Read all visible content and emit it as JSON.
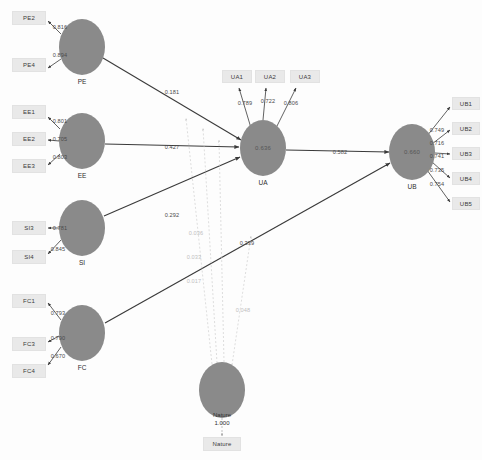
{
  "diagram": {
    "type": "sem-path-diagram",
    "colors": {
      "construct_fill": "#8a8a8a",
      "indicator_fill": "#e9e9e9",
      "edge": "#3a3a3a",
      "moderation_edge": "#c8c8c8",
      "background": "#fdfdfd"
    }
  },
  "constructs": [
    {
      "id": "PE",
      "label": "PE",
      "r2": "",
      "cx": 82,
      "cy": 47,
      "rx": 23,
      "ry": 28
    },
    {
      "id": "EE",
      "label": "EE",
      "r2": "",
      "cx": 82,
      "cy": 141,
      "rx": 23,
      "ry": 28
    },
    {
      "id": "SI",
      "label": "SI",
      "r2": "",
      "cx": 82,
      "cy": 228,
      "rx": 23,
      "ry": 28
    },
    {
      "id": "FC",
      "label": "FC",
      "r2": "",
      "cx": 82,
      "cy": 333,
      "rx": 23,
      "ry": 28
    },
    {
      "id": "UA",
      "label": "UA",
      "r2": "0.636",
      "cx": 263,
      "cy": 148,
      "rx": 23,
      "ry": 28
    },
    {
      "id": "UB",
      "label": "UB",
      "r2": "0.660",
      "cx": 412,
      "cy": 152,
      "rx": 23,
      "ry": 28
    },
    {
      "id": "NATURE",
      "label": "",
      "r2": "",
      "cx": 222,
      "cy": 390,
      "rx": 23,
      "ry": 28
    }
  ],
  "indicators": [
    {
      "id": "PE2",
      "label": "PE2",
      "x": 12,
      "y": 11,
      "w": 34,
      "h": 14
    },
    {
      "id": "PE4",
      "label": "PE4",
      "x": 12,
      "y": 58,
      "w": 34,
      "h": 14
    },
    {
      "id": "EE1",
      "label": "EE1",
      "x": 12,
      "y": 105,
      "w": 34,
      "h": 14
    },
    {
      "id": "EE2",
      "label": "EE2",
      "x": 12,
      "y": 132,
      "w": 34,
      "h": 14
    },
    {
      "id": "EE3",
      "label": "EE3",
      "x": 12,
      "y": 159,
      "w": 34,
      "h": 14
    },
    {
      "id": "SI3",
      "label": "SI3",
      "x": 12,
      "y": 221,
      "w": 34,
      "h": 14
    },
    {
      "id": "SI4",
      "label": "SI4",
      "x": 12,
      "y": 250,
      "w": 34,
      "h": 14
    },
    {
      "id": "FC1",
      "label": "FC1",
      "x": 12,
      "y": 294,
      "w": 34,
      "h": 14
    },
    {
      "id": "FC3",
      "label": "FC3",
      "x": 12,
      "y": 337,
      "w": 34,
      "h": 14
    },
    {
      "id": "FC4",
      "label": "FC4",
      "x": 12,
      "y": 364,
      "w": 34,
      "h": 14
    },
    {
      "id": "UA1",
      "label": "UA1",
      "x": 222,
      "y": 70,
      "w": 30,
      "h": 13
    },
    {
      "id": "UA2",
      "label": "UA2",
      "x": 255,
      "y": 70,
      "w": 30,
      "h": 13
    },
    {
      "id": "UA3",
      "label": "UA3",
      "x": 290,
      "y": 70,
      "w": 30,
      "h": 13
    },
    {
      "id": "UB1",
      "label": "UB1",
      "x": 452,
      "y": 97,
      "w": 28,
      "h": 13
    },
    {
      "id": "UB2",
      "label": "UB2",
      "x": 452,
      "y": 122,
      "w": 28,
      "h": 13
    },
    {
      "id": "UB3",
      "label": "UB3",
      "x": 452,
      "y": 147,
      "w": 28,
      "h": 13
    },
    {
      "id": "UB4",
      "label": "UB4",
      "x": 452,
      "y": 172,
      "w": 28,
      "h": 13
    },
    {
      "id": "UB5",
      "label": "UB5",
      "x": 452,
      "y": 197,
      "w": 28,
      "h": 13
    },
    {
      "id": "NatureInd",
      "label": "Nature",
      "x": 203,
      "y": 437,
      "w": 38,
      "h": 14
    }
  ],
  "measurement_loadings": [
    {
      "from": "PE",
      "to": "PE2",
      "value": "0.816",
      "lx": 60,
      "ly": 27
    },
    {
      "from": "PE",
      "to": "PE4",
      "value": "0.894",
      "lx": 60,
      "ly": 55
    },
    {
      "from": "EE",
      "to": "EE1",
      "value": "0.801",
      "lx": 60,
      "ly": 121
    },
    {
      "from": "EE",
      "to": "EE2",
      "value": "0.705",
      "lx": 60,
      "ly": 139
    },
    {
      "from": "EE",
      "to": "EE3",
      "value": "0.803",
      "lx": 60,
      "ly": 157
    },
    {
      "from": "SI",
      "to": "SI3",
      "value": "0.781",
      "lx": 60,
      "ly": 228
    },
    {
      "from": "SI",
      "to": "SI4",
      "value": "0.845",
      "lx": 58,
      "ly": 249
    },
    {
      "from": "FC",
      "to": "FC1",
      "value": "0.793",
      "lx": 58,
      "ly": 313
    },
    {
      "from": "FC",
      "to": "FC3",
      "value": "0.790",
      "lx": 58,
      "ly": 338
    },
    {
      "from": "FC",
      "to": "FC4",
      "value": "0.670",
      "lx": 58,
      "ly": 356
    },
    {
      "from": "UA",
      "to": "UA1",
      "value": "0.789",
      "lx": 245,
      "ly": 103
    },
    {
      "from": "UA",
      "to": "UA2",
      "value": "0.722",
      "lx": 268,
      "ly": 101
    },
    {
      "from": "UA",
      "to": "UA3",
      "value": "0.806",
      "lx": 291,
      "ly": 103
    },
    {
      "from": "UB",
      "to": "UB1",
      "value": "0.749",
      "lx": 437,
      "ly": 130
    },
    {
      "from": "UB",
      "to": "UB2",
      "value": "0.716",
      "lx": 437,
      "ly": 143
    },
    {
      "from": "UB",
      "to": "UB3",
      "value": "0.741",
      "lx": 437,
      "ly": 156
    },
    {
      "from": "UB",
      "to": "UB4",
      "value": "0.735",
      "lx": 437,
      "ly": 170
    },
    {
      "from": "UB",
      "to": "UB5",
      "value": "0.754",
      "lx": 437,
      "ly": 184
    }
  ],
  "structural_paths": [
    {
      "from": "PE",
      "to": "UA",
      "value": "0.181",
      "lx": 172,
      "ly": 92
    },
    {
      "from": "EE",
      "to": "UA",
      "value": "0.427",
      "lx": 172,
      "ly": 147
    },
    {
      "from": "SI",
      "to": "UA",
      "value": "0.292",
      "lx": 172,
      "ly": 215
    },
    {
      "from": "UA",
      "to": "UB",
      "value": "0.582",
      "lx": 340,
      "ly": 152
    },
    {
      "from": "FC",
      "to": "UB",
      "value": "0.339",
      "lx": 247,
      "ly": 243
    }
  ],
  "moderation_paths": [
    {
      "from": "Nature",
      "to": "PE-UA",
      "value": "0.036",
      "lx": 196,
      "ly": 233
    },
    {
      "from": "Nature",
      "to": "EE-UA",
      "value": "0.033",
      "lx": 194,
      "ly": 257
    },
    {
      "from": "Nature",
      "to": "SI-UA",
      "value": "0.017",
      "lx": 194,
      "ly": 281
    },
    {
      "from": "Nature",
      "to": "FC-UB",
      "value": "0.048",
      "lx": 243,
      "ly": 310
    }
  ],
  "moderator": {
    "name": "Nature",
    "loading": "1.000",
    "indicator_label": "Nature",
    "caption_x": 222,
    "caption_y": 412
  }
}
